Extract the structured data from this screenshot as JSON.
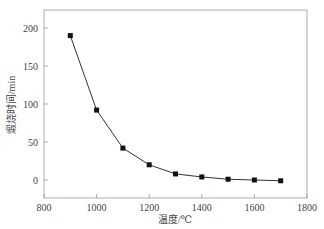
{
  "chart_data": {
    "type": "line",
    "title": "",
    "xlabel": "温度/℃",
    "ylabel": "煅烧时间/min",
    "xlim": [
      800,
      1800
    ],
    "ylim": [
      -22,
      225
    ],
    "xticks": [
      800,
      1000,
      1200,
      1400,
      1600,
      1800
    ],
    "yticks": [
      0,
      50,
      100,
      150,
      200
    ],
    "grid": false,
    "legend": null,
    "marker": "square",
    "series": [
      {
        "name": "煅烧时间",
        "x": [
          900,
          1000,
          1100,
          1200,
          1300,
          1400,
          1500,
          1600,
          1700
        ],
        "values": [
          190,
          92,
          42,
          20,
          8,
          4,
          1,
          0,
          -1
        ]
      }
    ],
    "colors": {
      "line": "#333333",
      "marker": "#111111",
      "frame": "#999999"
    }
  }
}
